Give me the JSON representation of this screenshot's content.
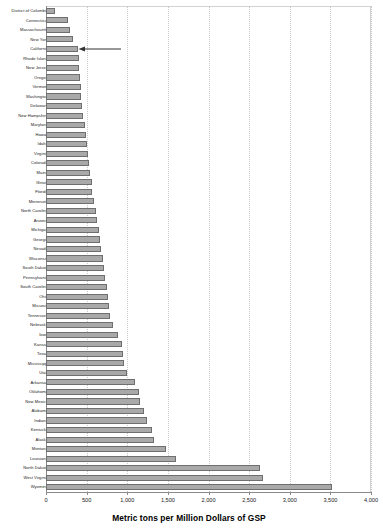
{
  "chart_data": {
    "type": "bar",
    "orientation": "horizontal",
    "title": "",
    "xlabel": "Metric tons per Million Dollars of GSP",
    "ylabel": "",
    "xlim": [
      0,
      4000
    ],
    "xticks": [
      0,
      500,
      1000,
      1500,
      2000,
      2500,
      3000,
      3500,
      4000
    ],
    "xtick_labels": [
      "0",
      "500",
      "1,000",
      "1,500",
      "2,000",
      "2,500",
      "3,000",
      "3,500",
      "4,000"
    ],
    "grid": "vertical-dotted",
    "legend": "none",
    "sort": "ascending",
    "categories": [
      "District of Columbia",
      "Connecticut",
      "Massachusetts",
      "New York",
      "California",
      "Rhode Island",
      "New Jersey",
      "Oregon",
      "Vermont",
      "Washington",
      "Delaware",
      "New Hampshire",
      "Maryland",
      "Hawaii",
      "Idaho",
      "Virginia",
      "Colorado",
      "Maine",
      "Illinois",
      "Florida",
      "Minnesota",
      "North Carolina",
      "Arizona",
      "Michigan",
      "Georgia",
      "Nevada",
      "Wisconsin",
      "South Dakota",
      "Pennsylvania",
      "South Carolina",
      "Ohio",
      "Missouri",
      "Tennessee",
      "Nebraska",
      "Iowa",
      "Kansas",
      "Texas",
      "Mississippi",
      "Utah",
      "Arkansas",
      "Oklahoma",
      "New Mexico",
      "Alabama",
      "Indiana",
      "Kentucky",
      "Alaska",
      "Montana",
      "Louisiana",
      "North Dakota",
      "West Virginia",
      "Wyoming"
    ],
    "values": [
      105,
      270,
      300,
      330,
      390,
      400,
      410,
      415,
      425,
      430,
      440,
      450,
      480,
      490,
      500,
      520,
      530,
      545,
      560,
      570,
      585,
      620,
      630,
      650,
      660,
      680,
      700,
      710,
      730,
      750,
      760,
      770,
      790,
      820,
      890,
      930,
      950,
      965,
      1000,
      1090,
      1140,
      1160,
      1210,
      1240,
      1300,
      1330,
      1480,
      1600,
      2630,
      2670,
      3520
    ],
    "annotations": [
      {
        "name": "california-arrow",
        "target": "California",
        "direction": "left",
        "text": ""
      }
    ],
    "colors": {
      "bar_fill": "#a9a9a9",
      "bar_stroke": "#6f6f6f",
      "gridline": "#c9c9c9",
      "axis": "#8a8a8a",
      "text": "#1a1a1a",
      "arrow": "#333333"
    }
  }
}
